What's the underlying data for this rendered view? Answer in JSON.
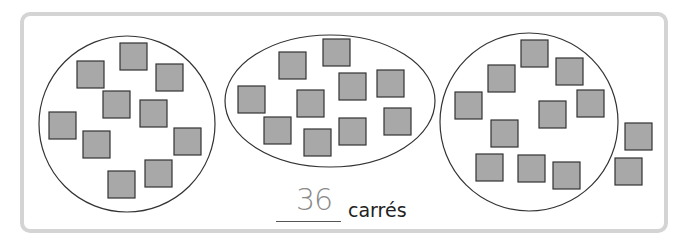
{
  "exercise": {
    "answer": "36",
    "unit_label": "carrés"
  },
  "groups": [
    {
      "shape": "circle",
      "square_count": 10
    },
    {
      "shape": "ellipse",
      "square_count": 10
    },
    {
      "shape": "circle",
      "square_count": 10
    }
  ],
  "loose_squares": 2,
  "colors": {
    "frame_border": "#d4d4d4",
    "square_fill": "#a8a8a8",
    "square_stroke": "#333333",
    "answer_text": "#8a8a8a"
  }
}
